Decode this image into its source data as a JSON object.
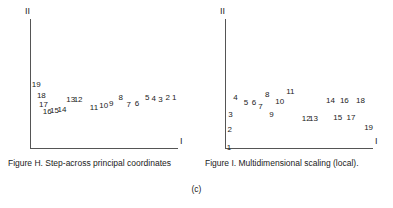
{
  "subfigure_label": "(c)",
  "panels": [
    {
      "id": "panel-h",
      "caption": "Figure H. Step-across principal coordinates",
      "axis_y_label": "II",
      "axis_x_label": "I",
      "chart_data": {
        "type": "scatter",
        "title": "Figure H. Step-across principal coordinates",
        "xlabel": "I",
        "ylabel": "II",
        "grid": false,
        "legend": "none",
        "point_style": "numeric-label-only",
        "xlim": [
          0,
          100
        ],
        "ylim": [
          0,
          100
        ],
        "labels": [
          "1",
          "2",
          "3",
          "4",
          "5",
          "6",
          "7",
          "8",
          "9",
          "10",
          "11",
          "12",
          "13",
          "14",
          "15",
          "16",
          "17",
          "18",
          "19"
        ],
        "points": [
          {
            "label": "1",
            "x": 96.0,
            "y": 42.0
          },
          {
            "label": "2",
            "x": 91.5,
            "y": 42.0
          },
          {
            "label": "3",
            "x": 86.5,
            "y": 40.5
          },
          {
            "label": "4",
            "x": 82.0,
            "y": 41.5
          },
          {
            "label": "5",
            "x": 77.5,
            "y": 42.5
          },
          {
            "label": "6",
            "x": 70.5,
            "y": 37.5
          },
          {
            "label": "7",
            "x": 65.0,
            "y": 37.0
          },
          {
            "label": "8",
            "x": 59.5,
            "y": 42.0
          },
          {
            "label": "9",
            "x": 53.0,
            "y": 37.5
          },
          {
            "label": "10",
            "x": 46.5,
            "y": 36.0
          },
          {
            "label": "11",
            "x": 40.0,
            "y": 34.5
          },
          {
            "label": "12",
            "x": 29.0,
            "y": 41.0
          },
          {
            "label": "13",
            "x": 24.0,
            "y": 41.0
          },
          {
            "label": "14",
            "x": 18.0,
            "y": 33.0
          },
          {
            "label": "15",
            "x": 13.0,
            "y": 32.0
          },
          {
            "label": "16",
            "x": 8.0,
            "y": 31.0
          },
          {
            "label": "17",
            "x": 5.5,
            "y": 37.0
          },
          {
            "label": "18",
            "x": 4.0,
            "y": 44.0
          },
          {
            "label": "19",
            "x": 0.5,
            "y": 52.0
          }
        ]
      }
    },
    {
      "id": "panel-i",
      "caption": "Figure I. Multidimensional scaling (local).",
      "axis_y_label": "II",
      "axis_x_label": "I",
      "chart_data": {
        "type": "scatter",
        "title": "Figure I. Multidimensional scaling (local).",
        "xlabel": "I",
        "ylabel": "II",
        "grid": false,
        "legend": "none",
        "point_style": "numeric-label-only",
        "xlim": [
          0,
          100
        ],
        "ylim": [
          0,
          100
        ],
        "labels": [
          "1",
          "2",
          "3",
          "4",
          "5",
          "6",
          "7",
          "8",
          "9",
          "10",
          "11",
          "12",
          "13",
          "14",
          "15",
          "16",
          "17",
          "18",
          "19"
        ],
        "points": [
          {
            "label": "1",
            "x": 0.5,
            "y": 3.0
          },
          {
            "label": "2",
            "x": 1.0,
            "y": 17.0
          },
          {
            "label": "3",
            "x": 1.5,
            "y": 29.0
          },
          {
            "label": "4",
            "x": 5.0,
            "y": 42.0
          },
          {
            "label": "5",
            "x": 12.0,
            "y": 38.5
          },
          {
            "label": "6",
            "x": 17.5,
            "y": 38.5
          },
          {
            "label": "7",
            "x": 22.0,
            "y": 35.5
          },
          {
            "label": "8",
            "x": 26.5,
            "y": 44.5
          },
          {
            "label": "9",
            "x": 29.5,
            "y": 29.0
          },
          {
            "label": "10",
            "x": 33.5,
            "y": 39.0
          },
          {
            "label": "11",
            "x": 41.0,
            "y": 47.0
          },
          {
            "label": "12",
            "x": 51.5,
            "y": 25.5
          },
          {
            "label": "13",
            "x": 56.5,
            "y": 25.5
          },
          {
            "label": "14",
            "x": 68.0,
            "y": 39.5
          },
          {
            "label": "15",
            "x": 73.0,
            "y": 26.5
          },
          {
            "label": "16",
            "x": 77.5,
            "y": 39.5
          },
          {
            "label": "17",
            "x": 82.0,
            "y": 26.5
          },
          {
            "label": "18",
            "x": 88.5,
            "y": 39.5
          },
          {
            "label": "19",
            "x": 94.0,
            "y": 19.0
          }
        ]
      }
    }
  ]
}
